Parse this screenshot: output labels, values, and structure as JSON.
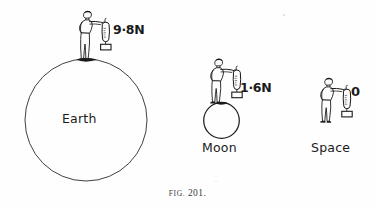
{
  "figure": {
    "caption_prefix": "FIG.",
    "caption_number": "201.",
    "caption_full": "FIG. 201.",
    "ink_color": "#1a1a1a",
    "background_color": "#fefefe"
  },
  "scenes": [
    {
      "id": "earth",
      "body_label": "Earth",
      "reading": "9·8N",
      "reading_value": 9.8,
      "reading_unit": "N",
      "body_shape": "large-circle",
      "person_pose": "standing-holding-spring-balance",
      "instrument": "spring-balance-with-hanging-weight"
    },
    {
      "id": "moon",
      "body_label": "Moon",
      "reading": "1·6N",
      "reading_value": 1.6,
      "reading_unit": "N",
      "body_shape": "small-circle",
      "person_pose": "standing-holding-spring-balance",
      "instrument": "spring-balance-with-hanging-weight"
    },
    {
      "id": "space",
      "body_label": "Space",
      "reading": "0",
      "reading_value": 0,
      "reading_unit": "",
      "body_shape": "none",
      "person_pose": "floating-holding-spring-balance",
      "instrument": "spring-balance-with-hanging-weight"
    }
  ]
}
